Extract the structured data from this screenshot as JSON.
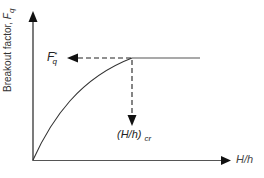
{
  "diagram": {
    "type": "curve-schematic",
    "y_axis": {
      "label_main": "Breakout factor, ",
      "label_symbol": "F",
      "label_subscript": "q"
    },
    "x_axis": {
      "label": "H/h"
    },
    "annotations": {
      "plateau_value": {
        "symbol": "F",
        "superscript": "*",
        "subscript": "q"
      },
      "critical_ratio": {
        "text": "(H/h)",
        "subscript": "cr"
      }
    },
    "colors": {
      "line": "#222222",
      "curve": "#333333",
      "dashed": "#222222"
    }
  }
}
